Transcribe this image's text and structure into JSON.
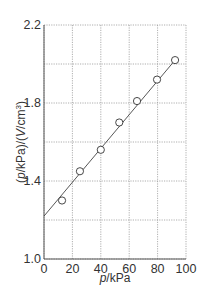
{
  "chart_data": {
    "type": "scatter",
    "title": "",
    "xlabel": "p/kPa",
    "ylabel": "(p/kPa)/(V/cm³)",
    "xlim": [
      0,
      100
    ],
    "ylim": [
      1.0,
      2.2
    ],
    "x_ticks": [
      0,
      20,
      40,
      60,
      80,
      100
    ],
    "x_tick_labels": [
      "0",
      "20",
      "40",
      "60",
      "80",
      "100"
    ],
    "y_ticks": [
      1.0,
      1.4,
      1.8,
      2.2
    ],
    "y_tick_labels": [
      "1.0",
      "1.4",
      "1.8",
      "2.2"
    ],
    "y_grid": [
      1.0,
      1.2,
      1.4,
      1.6,
      1.8,
      2.0,
      2.2
    ],
    "x_grid": [
      0,
      20,
      40,
      60,
      80,
      100
    ],
    "grid": true,
    "legend": null,
    "series": [
      {
        "name": "data",
        "marker": "open-circle",
        "x": [
          12.7,
          25.3,
          40.0,
          53.0,
          65.5,
          79.6,
          92.3
        ],
        "y": [
          1.3,
          1.45,
          1.56,
          1.7,
          1.81,
          1.92,
          2.02
        ]
      }
    ],
    "fit_line": {
      "x": [
        0,
        92.3
      ],
      "y": [
        1.22,
        2.02
      ]
    }
  },
  "labels": {
    "xlabel_italic": "p",
    "xlabel_rest": "/kPa",
    "ylabel_open": "(",
    "ylabel_italic": "p",
    "ylabel_mid": "/kPa)/(",
    "ylabel_V": "V",
    "ylabel_unit": "/cm",
    "ylabel_sup": "3",
    "ylabel_close": ")"
  }
}
